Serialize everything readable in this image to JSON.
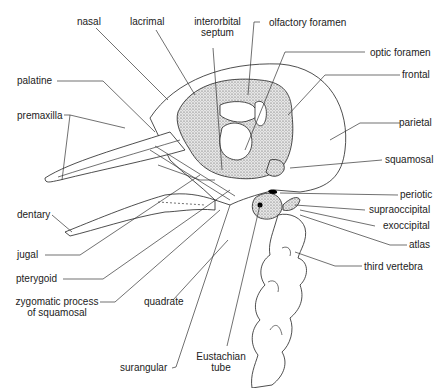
{
  "diagram": {
    "labels": {
      "nasal": "nasal",
      "lacrimal": "lacrimal",
      "interorbital_septum_1": "interorbital",
      "interorbital_septum_2": "septum",
      "olfactory_foramen": "olfactory foramen",
      "optic_foramen": "optic foramen",
      "frontal": "frontal",
      "palatine": "palatine",
      "premaxilla": "premaxilla",
      "parietal": "parietal",
      "squamosal": "squamosal",
      "periotic": "periotic",
      "supraoccipital": "supraoccipital",
      "exoccipital": "exoccipital",
      "dentary": "dentary",
      "atlas": "atlas",
      "jugal": "jugal",
      "third_vertebra": "third vertebra",
      "pterygoid": "pterygoid",
      "zygomatic_1": "zygomatic process",
      "zygomatic_2": "of squamosal",
      "quadrate": "quadrate",
      "surangular": "surangular",
      "eustachian_1": "Eustachian",
      "eustachian_2": "tube"
    }
  }
}
